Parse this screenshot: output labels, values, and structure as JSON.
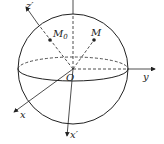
{
  "diagram": {
    "type": "sphere-coordinate-axes",
    "labels": {
      "z_prime": "z′",
      "M0": "M",
      "M0_sub": "0",
      "M": "M",
      "O": "O",
      "y": "y",
      "x": "x",
      "x_prime": "x′"
    },
    "colors": {
      "stroke": "#222222",
      "background": "#ffffff"
    }
  }
}
